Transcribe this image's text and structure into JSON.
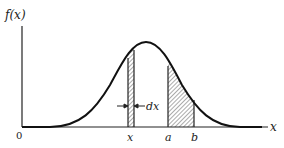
{
  "diagram": {
    "type": "probability-density-curve",
    "y_axis_label": "f(x)",
    "x_axis_label": "x",
    "origin_label": "0",
    "markers": {
      "x": "x",
      "a": "a",
      "b": "b"
    },
    "width_annotation": "dx",
    "colors": {
      "line": "#222222",
      "hatch": "#444444",
      "background": "#ffffff"
    }
  }
}
